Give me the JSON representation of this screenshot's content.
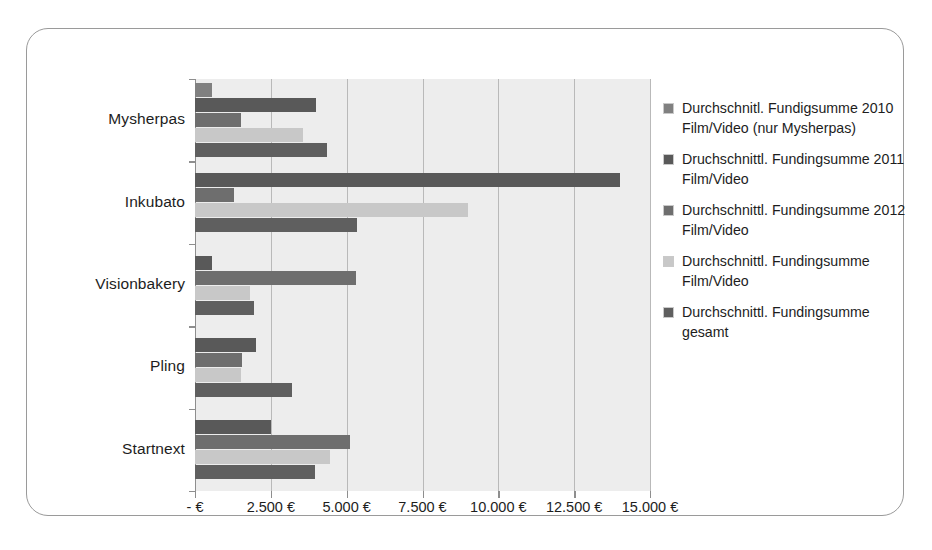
{
  "chart_data": {
    "type": "bar",
    "orientation": "horizontal",
    "title": "",
    "xlabel": "",
    "ylabel": "",
    "categories": [
      "Mysherpas",
      "Inkubato",
      "Visionbakery",
      "Pling",
      "Startnext"
    ],
    "xlim": [
      0,
      15000
    ],
    "xticks": [
      0,
      2500,
      5000,
      7500,
      10000,
      12500,
      15000
    ],
    "xticklabels": [
      "- €",
      "2.500 €",
      "5.000 €",
      "7.500 €",
      "10.000 €",
      "12.500 €",
      "15.000 €"
    ],
    "grid": true,
    "legend_position": "right",
    "currency": "€",
    "series": [
      {
        "name": "Durchschnitl. Fundigsumme 2010 Film/Video (nur Mysherpas)",
        "color": "#808080",
        "values": [
          550,
          null,
          null,
          null,
          null
        ]
      },
      {
        "name": "Druchschnittl. Fundingsumme 2011 Film/Video",
        "color": "#595959",
        "values": [
          4000,
          14000,
          550,
          2000,
          2500
        ]
      },
      {
        "name": "Durchschnittl. Fundingsumme 2012 Film/Video",
        "color": "#6e6e6e",
        "values": [
          1500,
          1300,
          5300,
          1550,
          5100
        ]
      },
      {
        "name": "Durchschnittl. Fundingsumme Film/Video",
        "color": "#c8c8c8",
        "values": [
          3550,
          9000,
          1800,
          1500,
          4450
        ]
      },
      {
        "name": "Durchschnittl. Fundingsumme gesamt",
        "color": "#5f5f5f",
        "values": [
          4350,
          5350,
          1950,
          3200,
          3950
        ]
      }
    ]
  },
  "legend": {
    "items": [
      {
        "label": "Durchschnitl. Fundigsumme 2010 Film/Video (nur Mysherpas)",
        "color": "#808080"
      },
      {
        "label": "Druchschnittl. Fundingsumme 2011 Film/Video",
        "color": "#595959"
      },
      {
        "label": "Durchschnittl. Fundingsumme 2012 Film/Video",
        "color": "#6e6e6e"
      },
      {
        "label": "Durchschnittl. Fundingsumme Film/Video",
        "color": "#c8c8c8"
      },
      {
        "label": "Durchschnittl. Fundingsumme gesamt",
        "color": "#5f5f5f"
      }
    ]
  },
  "colors": {
    "plot_background": "#ededed",
    "gridline": "#b9b9b9",
    "axis": "#8e8e8e",
    "frame_border": "#9a9a9a",
    "text": "#1d1d1d"
  }
}
